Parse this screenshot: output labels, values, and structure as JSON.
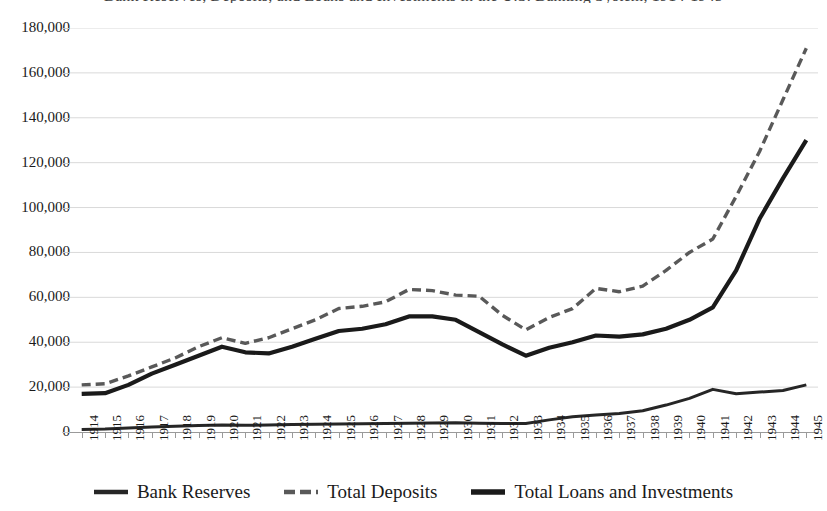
{
  "chart": {
    "title": "Bank Reserves, Deposits, and Loans and Investments in the U.S. Banking System, 1914-1945",
    "colors": {
      "bank_reserves": "#262626",
      "total_deposits": "#595959",
      "total_loans": "#1a1a1a",
      "gridline": "#d9d9d9",
      "axis": "#9a9a9a"
    }
  },
  "chart_data": {
    "type": "line",
    "title": "Bank Reserves, Deposits, and Loans and Investments in the U.S. Banking System, 1914-1945",
    "xlabel": "",
    "ylabel": "",
    "ylim": [
      0,
      180000
    ],
    "ytick_step": 20000,
    "grid": true,
    "legend_position": "bottom",
    "ytick_labels": [
      "0",
      "20,000",
      "40,000",
      "60,000",
      "80,000",
      "100,000",
      "120,000",
      "140,000",
      "160,000",
      "180,000"
    ],
    "ytick_values": [
      0,
      20000,
      40000,
      60000,
      80000,
      100000,
      120000,
      140000,
      160000,
      180000
    ],
    "categories": [
      "1914",
      "1915",
      "1916",
      "1917",
      "1918",
      "1919",
      "1920",
      "1921",
      "1922",
      "1923",
      "1924",
      "1925",
      "1926",
      "1927",
      "1928",
      "1929",
      "1930",
      "1931",
      "1932",
      "1933",
      "1934",
      "1935",
      "1936",
      "1937",
      "1938",
      "1939",
      "1940",
      "1941",
      "1942",
      "1943",
      "1944",
      "1945"
    ],
    "series": [
      {
        "name": "Bank Reserves",
        "style": "solid-thin",
        "color": "#262626",
        "values": [
          1100,
          1300,
          1800,
          2200,
          2600,
          2900,
          3100,
          3000,
          3100,
          3300,
          3500,
          3600,
          3700,
          3800,
          3900,
          4000,
          4100,
          3900,
          3800,
          3800,
          5400,
          6800,
          7600,
          8200,
          9500,
          12000,
          15000,
          19000,
          17000,
          17800,
          18500,
          21000
        ]
      },
      {
        "name": "Total Deposits",
        "style": "dashed",
        "color": "#595959",
        "values": [
          21000,
          21500,
          25000,
          29000,
          33000,
          38000,
          42000,
          39500,
          42000,
          46000,
          50000,
          55000,
          56000,
          58000,
          63500,
          63000,
          61000,
          60500,
          52000,
          45500,
          51000,
          55000,
          64000,
          62500,
          65000,
          72000,
          80000,
          86000,
          105000,
          125000,
          148000,
          171000
        ]
      },
      {
        "name": "Total Loans and Investments",
        "style": "solid-thick",
        "color": "#1a1a1a",
        "values": [
          17000,
          17300,
          21000,
          26000,
          30000,
          34000,
          38000,
          35500,
          35000,
          38000,
          41500,
          45000,
          46000,
          48000,
          51500,
          51500,
          50000,
          44500,
          39000,
          34000,
          37500,
          40000,
          43000,
          42500,
          43500,
          46000,
          50000,
          55500,
          72000,
          95000,
          113000,
          130000
        ]
      }
    ]
  },
  "legend": {
    "items": [
      {
        "label": "Bank Reserves"
      },
      {
        "label": "Total Deposits"
      },
      {
        "label": "Total Loans and Investments"
      }
    ]
  }
}
